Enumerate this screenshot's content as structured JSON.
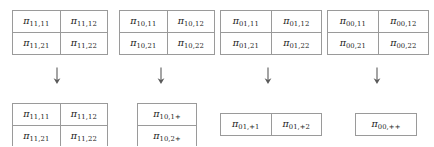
{
  "figure": {
    "symbol": "π",
    "arrow_glyph": "down-arrow",
    "border_color": "#9a9a9a",
    "background_color": "#ffffff",
    "text_color": "#1a1a1a"
  },
  "groups": [
    {
      "name": "pi-11",
      "top_table": {
        "shape": "2x2",
        "rows": [
          [
            {
              "base": "π",
              "sub": "11,11"
            },
            {
              "base": "π",
              "sub": "11,12"
            }
          ],
          [
            {
              "base": "π",
              "sub": "11,21"
            },
            {
              "base": "π",
              "sub": "11,22"
            }
          ]
        ]
      },
      "arrow": "↓",
      "bottom_table": {
        "shape": "2x2",
        "rows": [
          [
            {
              "base": "π",
              "sub": "11,11"
            },
            {
              "base": "π",
              "sub": "11,12"
            }
          ],
          [
            {
              "base": "π",
              "sub": "11,21"
            },
            {
              "base": "π",
              "sub": "11,22"
            }
          ]
        ]
      }
    },
    {
      "name": "pi-10",
      "top_table": {
        "shape": "2x2",
        "rows": [
          [
            {
              "base": "π",
              "sub": "10,11"
            },
            {
              "base": "π",
              "sub": "10,12"
            }
          ],
          [
            {
              "base": "π",
              "sub": "10,21"
            },
            {
              "base": "π",
              "sub": "10,22"
            }
          ]
        ]
      },
      "arrow": "↓",
      "bottom_table": {
        "shape": "2x1",
        "rows": [
          [
            {
              "base": "π",
              "sub": "10,1+"
            }
          ],
          [
            {
              "base": "π",
              "sub": "10,2+"
            }
          ]
        ]
      }
    },
    {
      "name": "pi-01",
      "top_table": {
        "shape": "2x2",
        "rows": [
          [
            {
              "base": "π",
              "sub": "01,11"
            },
            {
              "base": "π",
              "sub": "01,12"
            }
          ],
          [
            {
              "base": "π",
              "sub": "01,21"
            },
            {
              "base": "π",
              "sub": "01,22"
            }
          ]
        ]
      },
      "arrow": "↓",
      "bottom_table": {
        "shape": "1x2",
        "rows": [
          [
            {
              "base": "π",
              "sub": "01,+1"
            },
            {
              "base": "π",
              "sub": "01,+2"
            }
          ]
        ]
      }
    },
    {
      "name": "pi-00",
      "top_table": {
        "shape": "2x2",
        "rows": [
          [
            {
              "base": "π",
              "sub": "00,11"
            },
            {
              "base": "π",
              "sub": "00,12"
            }
          ],
          [
            {
              "base": "π",
              "sub": "00,21"
            },
            {
              "base": "π",
              "sub": "00,22"
            }
          ]
        ]
      },
      "arrow": "↓",
      "bottom_table": {
        "shape": "1x1",
        "rows": [
          [
            {
              "base": "π",
              "sub": "00,++"
            }
          ]
        ]
      }
    }
  ]
}
